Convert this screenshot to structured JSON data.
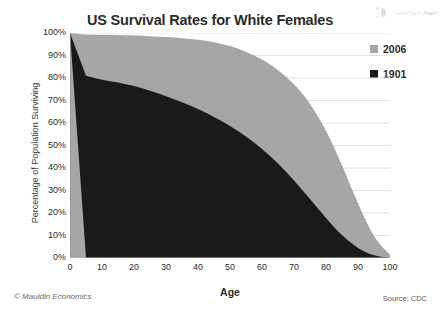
{
  "chart_data": {
    "type": "area",
    "title": "US Survival Rates for White Females",
    "xlabel": "Age",
    "ylabel": "Percentage of Population Surviving",
    "xlim": [
      0,
      100
    ],
    "ylim": [
      0,
      100
    ],
    "grid": "horizontal",
    "legend_position": "right",
    "x": [
      0,
      5,
      10,
      15,
      20,
      25,
      30,
      35,
      40,
      45,
      50,
      55,
      60,
      65,
      70,
      75,
      80,
      85,
      90,
      95,
      100
    ],
    "series": [
      {
        "name": "2006",
        "color": "#a6a6a6",
        "values": [
          100,
          99.3,
          99.2,
          99.1,
          98.9,
          98.6,
          98.2,
          97.7,
          97.0,
          95.9,
          94.2,
          91.7,
          88.2,
          83.5,
          77.2,
          68.5,
          56.6,
          41.2,
          24.3,
          9.8,
          1.5
        ]
      },
      {
        "name": "1901",
        "color": "#1a1a1a",
        "values": [
          100,
          81.0,
          79.2,
          78.0,
          76.4,
          74.3,
          71.9,
          69.2,
          66.2,
          62.7,
          58.7,
          54.0,
          48.5,
          42.0,
          34.5,
          26.2,
          17.8,
          10.2,
          4.5,
          1.2,
          0.0
        ]
      }
    ],
    "y_ticks": [
      "100%",
      "90%",
      "80%",
      "70%",
      "60%",
      "50%",
      "40%",
      "30%",
      "20%",
      "10%",
      "0%"
    ],
    "y_tick_values": [
      100,
      90,
      80,
      70,
      60,
      50,
      40,
      30,
      20,
      10,
      0
    ],
    "x_ticks": [
      "0",
      "10",
      "20",
      "30",
      "40",
      "50",
      "60",
      "70",
      "80",
      "90",
      "100"
    ],
    "x_tick_values": [
      0,
      10,
      20,
      30,
      40,
      50,
      60,
      70,
      80,
      90,
      100
    ]
  },
  "watermark": {
    "text_light": "TransTech",
    "text_bold": "Alert"
  },
  "footer": {
    "credit": "© Mauldin Economics",
    "source": "Source: CDC"
  },
  "colors": {
    "series_2006": "#a6a6a6",
    "series_1901": "#1a1a1a",
    "gridline": "#e2e2e2",
    "text": "#2b2b2b",
    "background": "#ffffff"
  }
}
